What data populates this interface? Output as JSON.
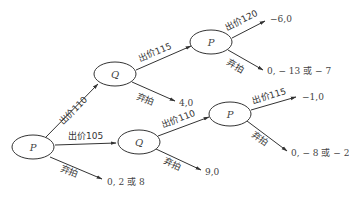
{
  "diagram": {
    "type": "game-tree",
    "nodes": [
      {
        "id": "root",
        "player": "P",
        "cx": 33,
        "cy": 147
      },
      {
        "id": "q1",
        "player": "Q",
        "cx": 115,
        "cy": 74
      },
      {
        "id": "p2",
        "player": "P",
        "cx": 211,
        "cy": 42
      },
      {
        "id": "q2",
        "player": "Q",
        "cx": 139,
        "cy": 142
      },
      {
        "id": "p3",
        "player": "P",
        "cx": 230,
        "cy": 114
      }
    ],
    "edges": [
      {
        "id": "root-bid110",
        "label": "出价110",
        "from": "root",
        "to": "q1"
      },
      {
        "id": "root-bid105",
        "label": "出价105",
        "from": "root",
        "to": "q2"
      },
      {
        "id": "root-pass",
        "label": "弃拍",
        "from": "root",
        "payoff": "0, 2 或 8"
      },
      {
        "id": "q1-bid115",
        "label": "出价115",
        "from": "q1",
        "to": "p2"
      },
      {
        "id": "q1-pass",
        "label": "弃拍",
        "from": "q1",
        "payoff": "4,0"
      },
      {
        "id": "p2-bid120",
        "label": "出价120",
        "from": "p2",
        "payoff": "−6,0"
      },
      {
        "id": "p2-pass",
        "label": "弃拍",
        "from": "p2",
        "payoff": "0, − 13 或 − 7"
      },
      {
        "id": "q2-bid110",
        "label": "出价110",
        "from": "q2",
        "to": "p3"
      },
      {
        "id": "q2-pass",
        "label": "弃拍",
        "from": "q2",
        "payoff": "9,0"
      },
      {
        "id": "p3-bid115",
        "label": "出价115",
        "from": "p3",
        "payoff": "−1,0"
      },
      {
        "id": "p3-pass",
        "label": "弃拍",
        "from": "p3",
        "payoff": "0, − 8 或 − 2"
      }
    ]
  },
  "labels": {
    "root_player": "P",
    "q1_player": "Q",
    "p2_player": "P",
    "q2_player": "Q",
    "p3_player": "P",
    "root_bid110": "出价110",
    "root_bid105": "出价105",
    "root_pass": "弃拍",
    "root_pass_payoff": "0, 2 或 8",
    "q1_bid115": "出价115",
    "q1_pass": "弃拍",
    "q1_pass_payoff": "4,0",
    "p2_bid120": "出价120",
    "p2_bid120_payoff": "−6,0",
    "p2_pass": "弃拍",
    "p2_pass_payoff": "0, − 13 或 − 7",
    "q2_bid110": "出价110",
    "q2_pass": "弃拍",
    "q2_pass_payoff": "9,0",
    "p3_bid115": "出价115",
    "p3_bid115_payoff": "−1,0",
    "p3_pass": "弃拍",
    "p3_pass_payoff": "0, − 8 或 − 2"
  },
  "colors": {
    "stroke": "#333333",
    "text": "#444444",
    "background": "#ffffff"
  }
}
